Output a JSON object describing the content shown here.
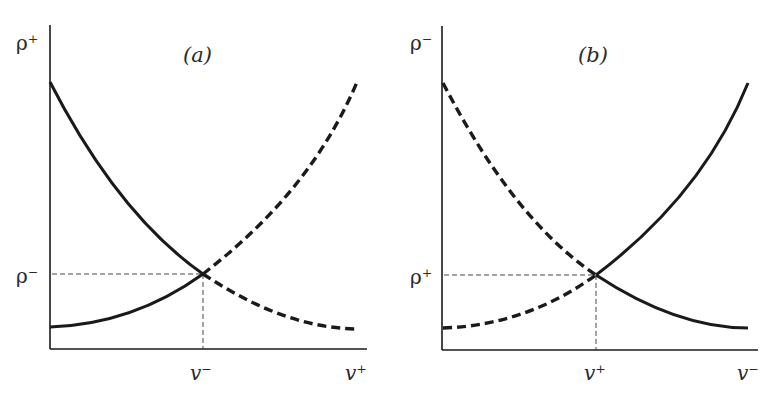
{
  "panels": [
    {
      "id": "a",
      "title": "(a)",
      "y_axis_label": "ρ⁺",
      "y_tick_label": "ρ⁻",
      "x_tick_label": "v⁻",
      "x_axis_label": "v⁺",
      "curves": [
        {
          "name": "solid-decreasing",
          "style": "solid",
          "shape": "decreasing",
          "segment": "left of intersection"
        },
        {
          "name": "solid-increasing",
          "style": "solid",
          "shape": "increasing",
          "segment": "left of intersection"
        },
        {
          "name": "dashed-increasing",
          "style": "dashed",
          "shape": "increasing",
          "segment": "right of intersection"
        },
        {
          "name": "dashed-decreasing",
          "style": "dashed",
          "shape": "decreasing",
          "segment": "right of intersection"
        }
      ]
    },
    {
      "id": "b",
      "title": "(b)",
      "y_axis_label": "ρ⁻",
      "y_tick_label": "ρ⁺",
      "x_tick_label": "v⁺",
      "x_axis_label": "v⁻",
      "curves": [
        {
          "name": "dashed-decreasing",
          "style": "dashed",
          "shape": "decreasing",
          "segment": "left of intersection"
        },
        {
          "name": "dashed-increasing",
          "style": "dashed",
          "shape": "increasing",
          "segment": "left of intersection"
        },
        {
          "name": "solid-increasing",
          "style": "solid",
          "shape": "increasing",
          "segment": "right of intersection"
        },
        {
          "name": "solid-decreasing",
          "style": "solid",
          "shape": "decreasing",
          "segment": "right of intersection"
        }
      ]
    }
  ],
  "colors": {
    "ink": "#1a1a1a",
    "guide": "#333333",
    "background": "#ffffff"
  }
}
